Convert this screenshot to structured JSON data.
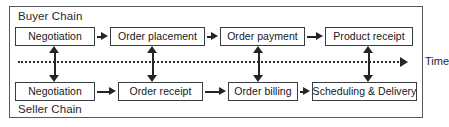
{
  "diagram": {
    "buyer_chain_label": "Buyer Chain",
    "seller_chain_label": "Seller Chain",
    "time_axis_label": "Time",
    "colors": {
      "frame_border": "#555a5d",
      "node_border": "#3a3d40",
      "arrow": "#232629",
      "text": "#15181a",
      "background": "#ffffff"
    },
    "buyer_nodes": [
      {
        "label": "Negotiation",
        "left": 15,
        "width": 80
      },
      {
        "label": "Order placement",
        "left": 110,
        "width": 95
      },
      {
        "label": "Order  payment",
        "left": 220,
        "width": 85
      },
      {
        "label": "Product  receipt",
        "left": 325,
        "width": 88
      }
    ],
    "seller_nodes": [
      {
        "label": "Negotiation",
        "left": 15,
        "width": 80
      },
      {
        "label": "Order receipt",
        "left": 118,
        "width": 85
      },
      {
        "label": "Order billing",
        "left": 228,
        "width": 70
      },
      {
        "label": "Scheduling & Delivery",
        "left": 312,
        "width": 105
      }
    ],
    "buyer_flow_arrows": [
      {
        "left": 97,
        "width": 11
      },
      {
        "left": 207,
        "width": 11
      },
      {
        "left": 307,
        "width": 16
      }
    ],
    "seller_flow_arrows": [
      {
        "left": 97,
        "width": 19
      },
      {
        "left": 205,
        "width": 21
      },
      {
        "left": 300,
        "width": 10
      }
    ],
    "link_arrows": [
      {
        "left": 49
      },
      {
        "left": 147
      },
      {
        "left": 253
      },
      {
        "left": 363
      }
    ]
  }
}
